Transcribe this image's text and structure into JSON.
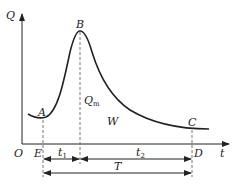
{
  "diagram": {
    "type": "hydrograph",
    "axes": {
      "y_label": "Q",
      "x_label": "t",
      "origin_label": "O"
    },
    "points": {
      "A": "A",
      "B": "B",
      "C": "C",
      "D": "D",
      "E": "E"
    },
    "annotations": {
      "peak_flow": "Q",
      "peak_flow_sub": "m",
      "volume": "W",
      "rise_time": "t",
      "rise_time_sub": "1",
      "recession_time": "t",
      "recession_time_sub": "2",
      "total_time": "T"
    },
    "colors": {
      "line": "#222222",
      "dash": "#666666"
    }
  }
}
